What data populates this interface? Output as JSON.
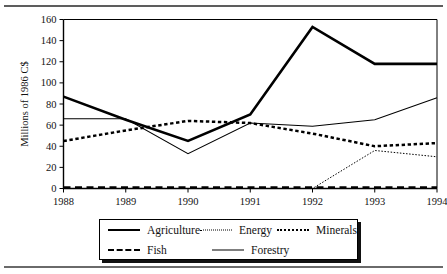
{
  "figure": {
    "rule_top": "horizontal-rule",
    "rule_bottom": "horizontal-rule"
  },
  "chart_data": {
    "type": "line",
    "title": "",
    "xlabel": "",
    "ylabel": "Millions of 1986 C$",
    "categories": [
      "1988",
      "1989",
      "1990",
      "1991",
      "1992",
      "1993",
      "1994"
    ],
    "x": [
      1988,
      1989,
      1990,
      1991,
      1992,
      1993,
      1994
    ],
    "xlim": [
      1988,
      1994
    ],
    "ylim": [
      0,
      160
    ],
    "yticks": [
      0,
      20,
      40,
      60,
      80,
      100,
      120,
      140,
      160
    ],
    "ytick_labels": [
      "0",
      "20",
      "40",
      "60",
      "80",
      "100",
      "120",
      "140",
      "160"
    ],
    "xtick_labels": [
      "1988",
      "1989",
      "1990",
      "1991",
      "1992",
      "1993",
      "1994"
    ],
    "grid": false,
    "legend_position": "below-plot",
    "series": [
      {
        "name": "Agriculture",
        "style": "solid-thick",
        "values": [
          87,
          65,
          45,
          70,
          153,
          118,
          118
        ]
      },
      {
        "name": "Energy",
        "style": "dotted-fine",
        "values": [
          0,
          0,
          0,
          0,
          0,
          36,
          30
        ]
      },
      {
        "name": "Minerals",
        "style": "dotted-thick",
        "values": [
          45,
          55,
          64,
          62,
          52,
          40,
          43
        ]
      },
      {
        "name": "Fish",
        "style": "dashed-thick",
        "values": [
          1,
          1,
          1,
          1,
          1,
          1,
          1
        ]
      },
      {
        "name": "Forestry",
        "style": "solid-thin",
        "values": [
          66,
          66,
          33,
          62,
          59,
          65,
          86
        ]
      }
    ]
  },
  "legend": {
    "items": [
      {
        "label": "Agriculture",
        "swatch": "solid-thick-line-icon"
      },
      {
        "label": "Energy",
        "swatch": "dotted-fine-line-icon"
      },
      {
        "label": "Minerals",
        "swatch": "dotted-thick-line-icon"
      },
      {
        "label": "Fish",
        "swatch": "dashed-thick-line-icon"
      },
      {
        "label": "Forestry",
        "swatch": "solid-thin-line-icon"
      }
    ]
  }
}
